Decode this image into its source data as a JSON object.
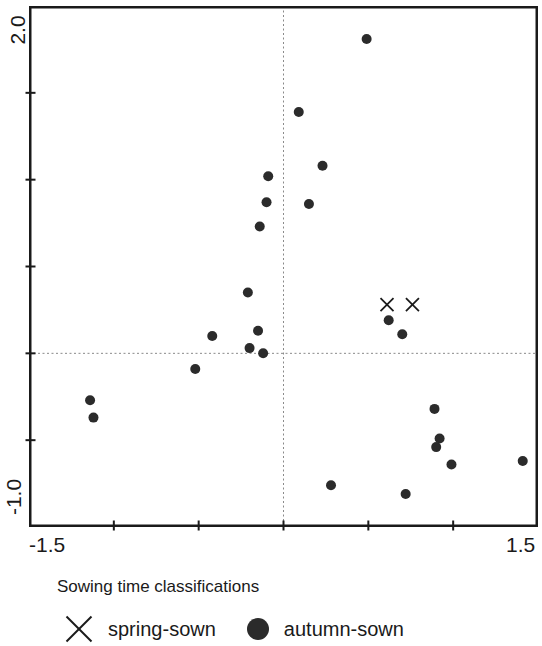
{
  "figure": {
    "background": "#ffffff",
    "axis_color": "#1a1a1a",
    "dot_color": "#2b2b2b",
    "reference_line_color": "#8a8a8a"
  },
  "axes": {
    "x": {
      "min": -1.5,
      "max": 1.5,
      "min_label": "-1.5",
      "max_label": "1.5",
      "ticks": [
        -1.0,
        -0.5,
        0.0,
        0.5,
        1.0
      ]
    },
    "y": {
      "min": -1.0,
      "max": 2.0,
      "min_label": "-1.0",
      "max_label": "2.0",
      "ticks": [
        1.5,
        1.0,
        0.5,
        0.0,
        -0.5
      ]
    }
  },
  "legend": {
    "title": "Sowing time classifications",
    "items": [
      {
        "marker": "x",
        "label": "spring-sown"
      },
      {
        "marker": "circle",
        "label": "autumn-sown"
      }
    ]
  },
  "chart_data": {
    "type": "scatter",
    "title": "",
    "xlabel": "",
    "ylabel": "",
    "xlim": [
      -1.5,
      1.5
    ],
    "ylim": [
      -1.0,
      2.0
    ],
    "grid": false,
    "reference_lines": {
      "x": 0.0,
      "y": 0.0,
      "style": "dotted"
    },
    "legend_position": "bottom",
    "series": [
      {
        "name": "spring-sown",
        "marker": "x",
        "points": [
          [
            0.61,
            0.28
          ],
          [
            0.76,
            0.28
          ]
        ]
      },
      {
        "name": "autumn-sown",
        "marker": "circle",
        "points": [
          [
            0.49,
            1.81
          ],
          [
            0.09,
            1.39
          ],
          [
            0.23,
            1.08
          ],
          [
            -0.09,
            1.02
          ],
          [
            -0.1,
            0.87
          ],
          [
            0.15,
            0.86
          ],
          [
            -0.14,
            0.73
          ],
          [
            -0.21,
            0.35
          ],
          [
            0.62,
            0.19
          ],
          [
            -0.15,
            0.13
          ],
          [
            0.7,
            0.11
          ],
          [
            -0.42,
            0.1
          ],
          [
            -0.2,
            0.03
          ],
          [
            -0.12,
            0.0
          ],
          [
            -0.52,
            -0.09
          ],
          [
            -1.14,
            -0.27
          ],
          [
            0.89,
            -0.32
          ],
          [
            -1.12,
            -0.37
          ],
          [
            0.92,
            -0.49
          ],
          [
            0.9,
            -0.54
          ],
          [
            1.41,
            -0.62
          ],
          [
            0.99,
            -0.64
          ],
          [
            0.28,
            -0.76
          ],
          [
            0.72,
            -0.81
          ]
        ]
      }
    ]
  }
}
